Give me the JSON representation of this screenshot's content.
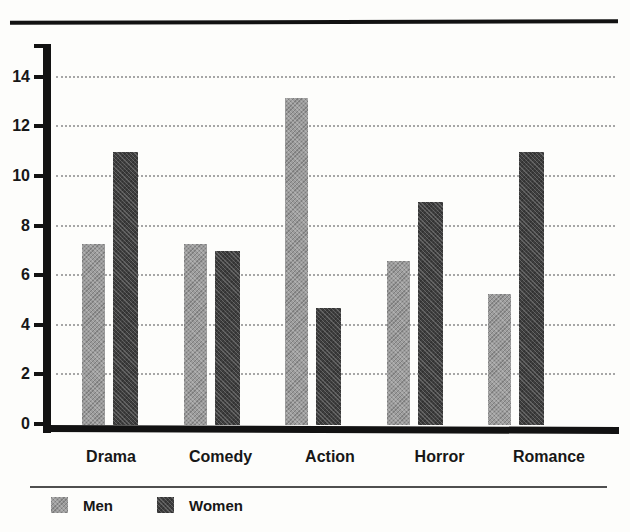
{
  "title": {
    "cropped_text": "Favorite Movie Genres"
  },
  "chart_data": {
    "type": "bar",
    "categories": [
      "Drama",
      "Comedy",
      "Action",
      "Horror",
      "Romance"
    ],
    "series": [
      {
        "name": "Men",
        "color": "#9c9c9c",
        "values": [
          7.3,
          7.3,
          13.2,
          6.6,
          5.3
        ]
      },
      {
        "name": "Women",
        "color": "#3e3e3e",
        "values": [
          11.0,
          7.0,
          4.7,
          9.0,
          11.0
        ]
      }
    ],
    "xlabel": "",
    "ylabel": "",
    "ylim": [
      0,
      15.3
    ],
    "yticks": [
      0,
      2,
      4,
      6,
      8,
      10,
      12,
      14
    ],
    "grid": "horizontal dotted gray lines at each y tick",
    "legend_position": "bottom-left below chart",
    "axis_color": "#121212",
    "gridline_color": "#989898"
  },
  "legend": {
    "items": [
      {
        "label": "Men",
        "color": "#9c9c9c"
      },
      {
        "label": "Women",
        "color": "#3e3e3e"
      }
    ]
  }
}
